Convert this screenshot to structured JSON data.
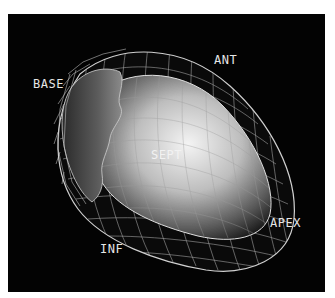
{
  "figure": {
    "background": "#030303",
    "wire_color": "#d8d8d8",
    "labels": {
      "base": "BASE",
      "ant": "ANT",
      "sept": "SEPT",
      "apex": "APEX",
      "inf": "INF"
    }
  }
}
